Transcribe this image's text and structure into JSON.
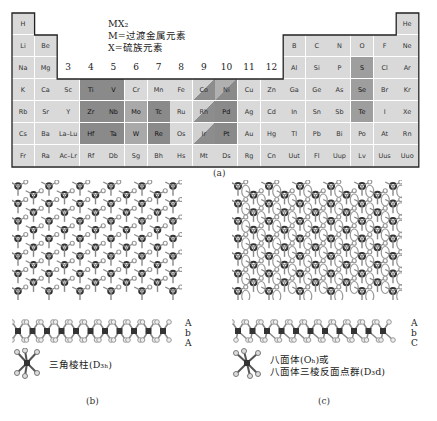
{
  "figure": {
    "formula": {
      "title": "MX₂",
      "line_m": "M=过渡金属元素",
      "line_x": "X=硫族元素"
    },
    "group_numbers": [
      "3",
      "4",
      "5",
      "6",
      "7",
      "8",
      "9",
      "10",
      "11",
      "12"
    ],
    "periodic_table": {
      "rows": [
        [
          "H",
          "",
          "",
          "",
          "",
          "",
          "",
          "",
          "",
          "",
          "",
          "",
          "",
          "",
          "",
          "",
          "",
          "He"
        ],
        [
          "Li",
          "Be",
          "",
          "",
          "",
          "",
          "",
          "",
          "",
          "",
          "",
          "",
          "B",
          "C",
          "N",
          "O",
          "F",
          "Ne"
        ],
        [
          "Na",
          "Mg",
          "",
          "",
          "",
          "",
          "",
          "",
          "",
          "",
          "",
          "",
          "Al",
          "Si",
          "P",
          "S",
          "Cl",
          "Ar"
        ],
        [
          "K",
          "Ca",
          "Sc",
          "Ti",
          "V",
          "Cr",
          "Mn",
          "Fe",
          "Co",
          "Ni",
          "Cu",
          "Zn",
          "Ga",
          "Ge",
          "As",
          "Se",
          "Br",
          "Kr"
        ],
        [
          "Rb",
          "Sr",
          "Y",
          "Zr",
          "Nb",
          "Mo",
          "Tc",
          "Ru",
          "Rh",
          "Pd",
          "Ag",
          "Cd",
          "In",
          "Sn",
          "Sb",
          "Te",
          "I",
          "Xe"
        ],
        [
          "Cs",
          "Ba",
          "La–Lu",
          "Hf",
          "Ta",
          "W",
          "Re",
          "Os",
          "Ir",
          "Pt",
          "Au",
          "Hg",
          "Tl",
          "Pb",
          "Bi",
          "Po",
          "At",
          "Rn"
        ],
        [
          "Fr",
          "Ra",
          "Ac–Lr",
          "Rf",
          "Db",
          "Sg",
          "Bh",
          "Hs",
          "Mt",
          "Ds",
          "Rg",
          "Cn",
          "Uut",
          "Fl",
          "Uup",
          "Lv",
          "Uus",
          "Uuo"
        ]
      ],
      "highlight_dark": [
        "Ti",
        "V",
        "Zr",
        "Nb",
        "Hf",
        "Ta",
        "Tc",
        "Re",
        "Pd",
        "Pt"
      ],
      "highlight_medium": [
        "Mo",
        "W"
      ],
      "highlight_partial_diagonal": [
        "Co",
        "Rh",
        "Ir",
        "Ni"
      ],
      "highlight_chalcogen": [
        "S",
        "Se",
        "Te"
      ]
    },
    "caption_a": "(a)",
    "panel_b": {
      "stacking": [
        "A",
        "b",
        "A"
      ],
      "coordination_label": "三角棱柱(D₃ₕ)",
      "caption": "(b)"
    },
    "panel_c": {
      "stacking": [
        "A",
        "b",
        "C"
      ],
      "coordination_line1": "八面体(Oₕ)或",
      "coordination_line2": "八面体三棱反面点群(D₃d)",
      "caption": "(c)"
    }
  }
}
